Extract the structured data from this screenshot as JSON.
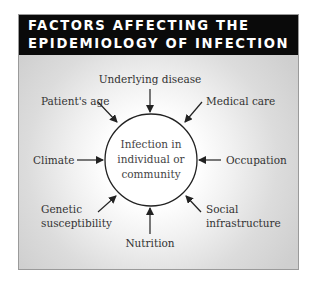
{
  "title": {
    "line1": "FACTORS AFFECTING THE",
    "line2": "EPIDEMIOLOGY OF INFECTION"
  },
  "center": {
    "line1": "Infection in",
    "line2": "individual or",
    "line3": "community"
  },
  "factors": {
    "top": "Underlying disease",
    "top_left": "Patient's age",
    "top_right": "Medical care",
    "left": "Climate",
    "right": "Occupation",
    "bottom_left_1": "Genetic",
    "bottom_left_2": "susceptibility",
    "bottom_right_1": "Social",
    "bottom_right_2": "infrastructure",
    "bottom": "Nutrition"
  },
  "colors": {
    "header_bg": "#0a0a0a",
    "header_text": "#ffffff",
    "panel_gray": "#cfcfcf",
    "arrow": "#222222"
  }
}
